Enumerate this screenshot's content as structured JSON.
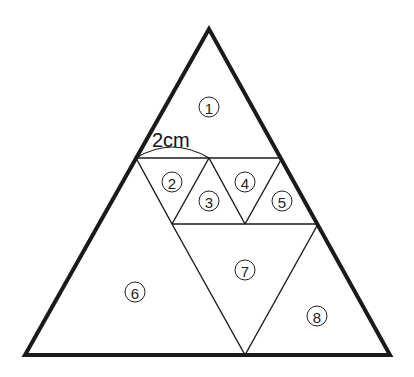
{
  "diagram": {
    "dimension_label": "2cm",
    "regions": [
      {
        "id": "1",
        "label": "①",
        "x": 209,
        "y": 107
      },
      {
        "id": "2",
        "label": "②",
        "x": 172,
        "y": 182
      },
      {
        "id": "3",
        "label": "③",
        "x": 209,
        "y": 201
      },
      {
        "id": "4",
        "label": "④",
        "x": 245,
        "y": 182
      },
      {
        "id": "5",
        "label": "⑤",
        "x": 282,
        "y": 201
      },
      {
        "id": "6",
        "label": "⑥",
        "x": 135,
        "y": 292
      },
      {
        "id": "7",
        "label": "⑦",
        "x": 245,
        "y": 270
      },
      {
        "id": "8",
        "label": "⑧",
        "x": 317,
        "y": 316
      }
    ],
    "colors": {
      "stroke": "#1a1a1a",
      "background": "#ffffff"
    }
  }
}
